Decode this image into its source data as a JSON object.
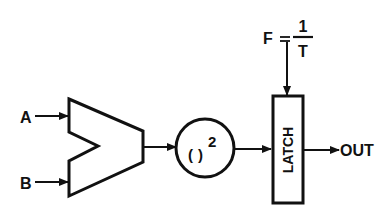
{
  "diagram": {
    "type": "block-diagram",
    "inputs": [
      {
        "label": "A"
      },
      {
        "label": "B"
      }
    ],
    "blocks": {
      "subtractor": {
        "shape": "notched-trapezoid"
      },
      "squarer": {
        "open": "(",
        "close": ")",
        "exponent": "2"
      },
      "latch": {
        "label": "LATCH"
      }
    },
    "clock": {
      "lhs": "F",
      "equals": "=",
      "numerator": "1",
      "denominator": "T"
    },
    "output": {
      "label": "OUT"
    },
    "colors": {
      "stroke": "#111111",
      "background": "#ffffff"
    }
  }
}
